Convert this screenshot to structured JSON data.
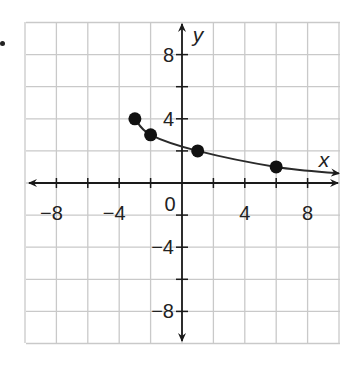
{
  "chart_data": {
    "type": "scatter",
    "title": "",
    "xlabel": "x",
    "ylabel": "y",
    "xlim": [
      -10,
      10
    ],
    "ylim": [
      -10,
      10
    ],
    "grid": true,
    "grid_step": 2,
    "x_tick_labels": [
      {
        "value": -8,
        "label": "−8"
      },
      {
        "value": -4,
        "label": "−4"
      },
      {
        "value": 4,
        "label": "4"
      },
      {
        "value": 8,
        "label": "8"
      }
    ],
    "y_tick_labels": [
      {
        "value": 8,
        "label": "8"
      },
      {
        "value": 4,
        "label": "4"
      },
      {
        "value": -4,
        "label": "−4"
      },
      {
        "value": -8,
        "label": "−8"
      }
    ],
    "origin_label": "0",
    "series": [
      {
        "name": "curve",
        "points": [
          {
            "x": -3,
            "y": 4
          },
          {
            "x": -2,
            "y": 3
          },
          {
            "x": 1,
            "y": 2
          },
          {
            "x": 6,
            "y": 1
          }
        ],
        "curve_end": {
          "x": 10,
          "y": 0.6
        },
        "end_arrow": true
      }
    ]
  },
  "colors": {
    "grid": "#c9c9c9",
    "axis": "#1a1a1a",
    "curve": "#2a2a2a",
    "point": "#111111",
    "text": "#222222"
  }
}
